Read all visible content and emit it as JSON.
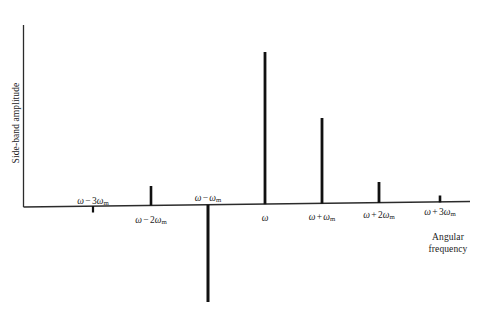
{
  "figure": {
    "name": "frequency-modulation-sideband-spectrum",
    "background_color": "#ffffff",
    "line_color": "#1b1b1b",
    "spike_color": "#111111"
  },
  "axes": {
    "y_axis_label": "Side-band amplitude",
    "x_axis_label_line1": "Angular",
    "x_axis_label_line2": "frequency",
    "x_axis_label": "Angular frequency"
  },
  "chart_data": {
    "type": "bar",
    "title": "",
    "subtitle": "",
    "xlabel": "Angular frequency",
    "ylabel": "Side-band amplitude",
    "grid": false,
    "legend": false,
    "axis_style": "spike / stem plot with signed amplitudes about a horizontal zero axis",
    "categories": [
      "ω − 3ωm",
      "ω − 2ωm",
      "ω − ωm",
      "ω",
      "ω + ωm",
      "ω + 2ωm",
      "ω + 3ωm"
    ],
    "values": [
      -0.06,
      0.14,
      -0.62,
      1.0,
      0.57,
      0.16,
      0.06
    ],
    "ylim": [
      -0.7,
      1.1
    ],
    "tick_labels": [
      {
        "text_html": "<span class=\"om\">ω</span><span class=\"op\">−</span>3<span class=\"om\">ω</span><sub>m</sub>",
        "x": 93,
        "y": 196,
        "side": "above"
      },
      {
        "text_html": "<span class=\"om\">ω</span><span class=\"op\">−</span>2<span class=\"om\">ω</span><sub>m</sub>",
        "x": 151,
        "y": 215,
        "side": "below"
      },
      {
        "text_html": "<span class=\"om\">ω</span><span class=\"op\">−</span><span class=\"om\">ω</span><sub>m</sub>",
        "x": 208,
        "y": 193,
        "side": "above"
      },
      {
        "text_html": "<span class=\"om\">ω</span>",
        "x": 265,
        "y": 213,
        "side": "below"
      },
      {
        "text_html": "<span class=\"om\">ω</span><span class=\"op\">+</span><span class=\"om\">ω</span><sub>m</sub>",
        "x": 322,
        "y": 212,
        "side": "below"
      },
      {
        "text_html": "<span class=\"om\">ω</span><span class=\"op\">+</span>2<span class=\"om\">ω</span><sub>m</sub>",
        "x": 379,
        "y": 210,
        "side": "below"
      },
      {
        "text_html": "<span class=\"om\">ω</span><span class=\"op\">+</span>3<span class=\"om\">ω</span><sub>m</sub>",
        "x": 440,
        "y": 207,
        "side": "below"
      }
    ],
    "spikes": [
      {
        "label": "ω − 3ωm",
        "x": 93,
        "base_y": 206.0,
        "tip_y": 212.5,
        "width": 2.2,
        "direction": "down"
      },
      {
        "label": "ω − 2ωm",
        "x": 151,
        "base_y": 205.4,
        "tip_y": 186.0,
        "width": 2.6,
        "direction": "up"
      },
      {
        "label": "ω − ωm",
        "x": 208,
        "base_y": 204.8,
        "tip_y": 302.0,
        "width": 3.0,
        "direction": "down"
      },
      {
        "label": "ω",
        "x": 265,
        "base_y": 204.2,
        "tip_y": 52.0,
        "width": 2.8,
        "direction": "up"
      },
      {
        "label": "ω + ωm",
        "x": 322,
        "base_y": 203.6,
        "tip_y": 118.0,
        "width": 2.8,
        "direction": "up"
      },
      {
        "label": "ω + 2ωm",
        "x": 379,
        "base_y": 203.0,
        "tip_y": 182.0,
        "width": 2.8,
        "direction": "up"
      },
      {
        "label": "ω + 3ωm",
        "x": 440,
        "base_y": 202.4,
        "tip_y": 195.5,
        "width": 2.6,
        "direction": "up"
      }
    ]
  },
  "geometry": {
    "y_axis": {
      "x": 23.5,
      "y_top": 25,
      "y_bottom": 207
    },
    "x_axis": {
      "x_start": 23.5,
      "y_start": 207,
      "x_end": 470,
      "y_end": 201.5
    }
  }
}
